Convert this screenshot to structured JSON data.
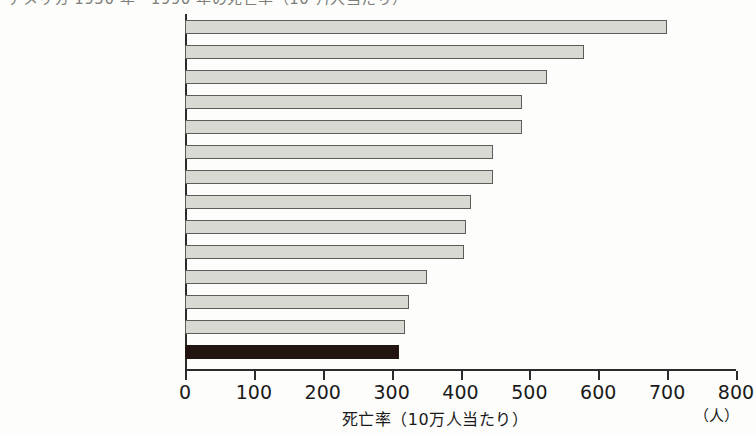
{
  "chart_data": {
    "type": "bar",
    "orientation": "horizontal",
    "title": "アメリカ 1950 年・1990 年の死亡率（10 万人当たり）",
    "title_truncated": true,
    "xlabel": "死亡率（10万人当たり）",
    "xunit": "（人）",
    "ylabel": "",
    "xlim": [
      0,
      800
    ],
    "xticks": [
      0,
      100,
      200,
      300,
      400,
      500,
      600,
      700,
      800
    ],
    "xtick_labels": [
      "0",
      "100",
      "200",
      "300",
      "400",
      "500",
      "600",
      "700",
      "800"
    ],
    "grid": false,
    "legend": "none",
    "categories": [
      "アメリカ",
      "ニュージーランド",
      "イギリス",
      "オーストラリア",
      "オランダ",
      "オーストリア",
      "デンマーク",
      "ドイツ",
      "スペイン",
      "フランス",
      "ノルウェー",
      "フィンランド",
      "スウェーデン",
      "日本"
    ],
    "values": [
      700,
      580,
      525,
      490,
      490,
      447,
      447,
      415,
      408,
      405,
      352,
      325,
      320,
      310
    ],
    "highlight_category": "日本",
    "colors": {
      "bar_fill": "#d9d9d4",
      "bar_border": "#5c5c58",
      "highlight_fill": "#221510",
      "axis": "#2b2b2b",
      "text": "#1a1a1a",
      "background": "#fdfdfb"
    }
  }
}
